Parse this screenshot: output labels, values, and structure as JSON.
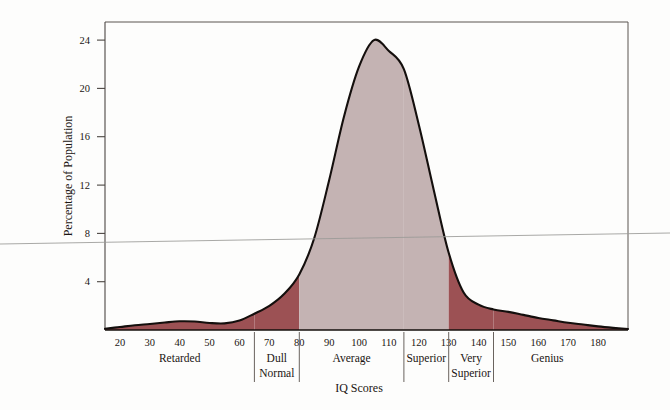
{
  "chart_data": {
    "type": "area",
    "title": "",
    "xlabel": "IQ Scores",
    "ylabel": "Percentage of Population",
    "xlim": [
      15,
      190
    ],
    "ylim": [
      0,
      25.5
    ],
    "grid": false,
    "legend": "none",
    "x_ticks": [
      20,
      30,
      40,
      50,
      60,
      70,
      80,
      90,
      100,
      110,
      120,
      130,
      140,
      150,
      160,
      170,
      180
    ],
    "y_ticks": [
      4,
      8,
      12,
      16,
      20,
      24
    ],
    "x": [
      15,
      20,
      25,
      30,
      35,
      40,
      45,
      50,
      55,
      60,
      65,
      70,
      75,
      80,
      85,
      90,
      95,
      100,
      105,
      110,
      115,
      120,
      125,
      130,
      135,
      140,
      145,
      150,
      155,
      160,
      165,
      170,
      175,
      180,
      185,
      190
    ],
    "values": [
      0.1,
      0.25,
      0.4,
      0.5,
      0.62,
      0.72,
      0.7,
      0.58,
      0.55,
      0.78,
      1.35,
      2.0,
      3.0,
      4.6,
      7.6,
      12.4,
      17.7,
      21.8,
      24.0,
      23.1,
      21.6,
      17.0,
      11.6,
      6.4,
      3.1,
      2.1,
      1.7,
      1.5,
      1.25,
      1.0,
      0.8,
      0.6,
      0.45,
      0.3,
      0.18,
      0.08
    ],
    "bands": [
      {
        "name": "Retarded",
        "from": 15,
        "to": 65,
        "color": "#9c5154",
        "label_x": 40
      },
      {
        "name": "Dull Normal",
        "from": 65,
        "to": 80,
        "color": "#9c5154",
        "label_x": 72.5
      },
      {
        "name": "Average",
        "from": 80,
        "to": 115,
        "color": "#c4b3b3",
        "label_x": 97.5
      },
      {
        "name": "Superior",
        "from": 115,
        "to": 130,
        "color": "#c4b3b3",
        "label_x": 122.5
      },
      {
        "name": "Very Superior",
        "from": 130,
        "to": 145,
        "color": "#9c5154",
        "label_x": 137.5
      },
      {
        "name": "Genius",
        "from": 145,
        "to": 190,
        "color": "#9c5154",
        "label_x": 163
      }
    ],
    "band_dividers": [
      65,
      80,
      115,
      130,
      145
    ],
    "colors": {
      "fill_dark_red": "#9c5154",
      "fill_light_mauve": "#c4b3b3",
      "outline": "#140f0d",
      "axis": "#5a5450",
      "background": "#fdfdfc"
    },
    "category_labels": [
      {
        "lines": [
          "Retarded"
        ],
        "x": 40
      },
      {
        "lines": [
          "Dull",
          "Normal"
        ],
        "x": 72.5
      },
      {
        "lines": [
          "Average"
        ],
        "x": 97.5
      },
      {
        "lines": [
          "Superior"
        ],
        "x": 122.5
      },
      {
        "lines": [
          "Very",
          "Superior"
        ],
        "x": 137.5
      },
      {
        "lines": [
          "Genius"
        ],
        "x": 163
      }
    ]
  },
  "artifact": {
    "scan_line_label": "scan-artifact-line"
  }
}
